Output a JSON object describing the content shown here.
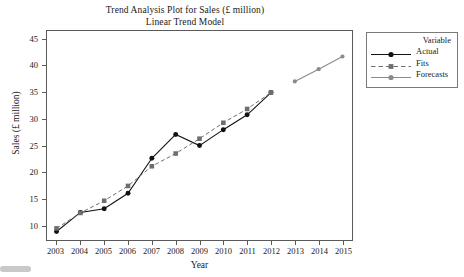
{
  "titles": {
    "line1": "Trend Analysis Plot for Sales (£ million)",
    "line2": "Linear Trend Model"
  },
  "axes": {
    "x_title": "Year",
    "y_title": "Sales (£ million)"
  },
  "legend": {
    "title": "Variable",
    "entries": [
      {
        "label": "Actual",
        "color": "#121212",
        "style": "solid",
        "marker": "circle"
      },
      {
        "label": "Fits",
        "color": "#6e6e6e",
        "style": "dashed",
        "marker": "square"
      },
      {
        "label": "Forecasts",
        "color": "#8a8a8a",
        "style": "solid",
        "marker": "circle"
      }
    ]
  },
  "colors": {
    "actual": "#121212",
    "fits": "#6e6e6e",
    "forecasts": "#8a8a8a",
    "frame": "#5a5a5a",
    "background": "#ffffff"
  },
  "chart_data": {
    "type": "line",
    "xlabel": "Year",
    "ylabel": "Sales (£ million)",
    "x": [
      2003,
      2004,
      2005,
      2006,
      2007,
      2008,
      2009,
      2010,
      2011,
      2012,
      2013,
      2014,
      2015
    ],
    "xlim": [
      2002.6,
      2015.4
    ],
    "ylim": [
      7.2,
      46.6
    ],
    "yticks": [
      10,
      15,
      20,
      25,
      30,
      35,
      40,
      45
    ],
    "xticks": [
      2003,
      2004,
      2005,
      2006,
      2007,
      2008,
      2009,
      2010,
      2011,
      2012,
      2013,
      2014,
      2015
    ],
    "grid": false,
    "legend_position": "right-outside",
    "series": [
      {
        "name": "Actual",
        "x": [
          2003,
          2004,
          2005,
          2006,
          2007,
          2008,
          2009,
          2010,
          2011,
          2012
        ],
        "values": [
          8.8,
          12.4,
          13.1,
          16.0,
          22.6,
          27.1,
          25.0,
          28.0,
          30.8,
          35.0
        ],
        "style": "solid",
        "marker": "circle",
        "color": "#121212"
      },
      {
        "name": "Fits",
        "x": [
          2003,
          2004,
          2005,
          2006,
          2007,
          2008,
          2009,
          2010,
          2011,
          2012
        ],
        "values": [
          9.4,
          12.3,
          14.6,
          17.4,
          21.1,
          23.5,
          26.3,
          29.3,
          31.9,
          35.0
        ],
        "style": "dashed",
        "marker": "square",
        "color": "#6e6e6e"
      },
      {
        "name": "Forecasts",
        "x": [
          2013,
          2014,
          2015
        ],
        "values": [
          37.1,
          39.4,
          41.8
        ],
        "style": "solid",
        "marker": "circle",
        "color": "#8a8a8a"
      }
    ]
  }
}
